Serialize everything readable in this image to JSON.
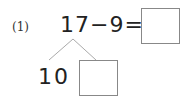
{
  "problem": {
    "number_label": "(1)",
    "equation": "17−9=",
    "answer_box": "",
    "decomposition": {
      "left_part": "10",
      "right_part_box": ""
    }
  }
}
